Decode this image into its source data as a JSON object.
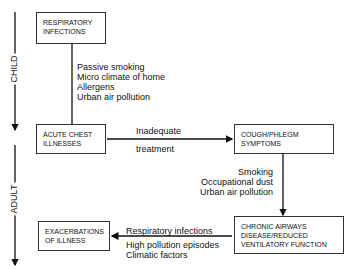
{
  "phases": {
    "child": "CHILD",
    "adult": "ADULT"
  },
  "boxes": {
    "resp": "RESPIRATORY\nINFECTIONS",
    "acute": "ACUTE CHEST\nILLNESSES",
    "cough": "COUGH/PHLEGM\nSYMPTOMS",
    "chronic": "CHRONIC AIRWAYS\nDISEASE/REDUCED\nVENTILATORY FUNCTION",
    "exac": "EXACERBATIONS\nOF ILLNESS"
  },
  "labels": {
    "child_factors": "Passive smoking\nMicro climate of home\nAllergens\nUrban air pollution",
    "inadequate": "Inadequate",
    "treatment": "treatment",
    "adult_factors": "Smoking\nOccupational dust\nUrban air pollution",
    "resp_infections": "Respiratory infections",
    "exac_factors": "High pollution episodes\nClimatic factors"
  }
}
